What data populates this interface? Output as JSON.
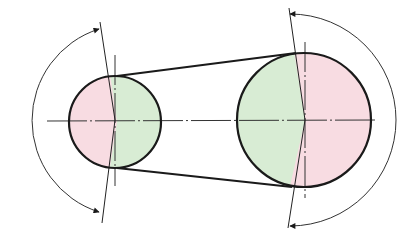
{
  "diagram": {
    "type": "belt-drive-wrap-angle",
    "colors": {
      "background": "#ffffff",
      "outline": "#1a1a1a",
      "thin_line": "#333333",
      "wrap_fill": "#d8ecd4",
      "free_fill": "#f8dce2"
    },
    "small_pulley": {
      "cx": 115,
      "cy": 122,
      "r": 46
    },
    "large_pulley": {
      "cx": 304,
      "cy": 120,
      "r": 67
    },
    "belt": {
      "upper_start": [
        117,
        76
      ],
      "upper_end": [
        296,
        53
      ],
      "lower_start": [
        117,
        168
      ],
      "lower_end": [
        292,
        187
      ]
    },
    "center_line": {
      "x1": 47,
      "x2": 378,
      "y": 121
    },
    "small_arc": {
      "label": "wrap-angle-small",
      "cx": 115,
      "cy": 122,
      "r": 96
    },
    "large_arc": {
      "label": "wrap-angle-large",
      "cx": 304,
      "cy": 120,
      "r": 106
    }
  }
}
